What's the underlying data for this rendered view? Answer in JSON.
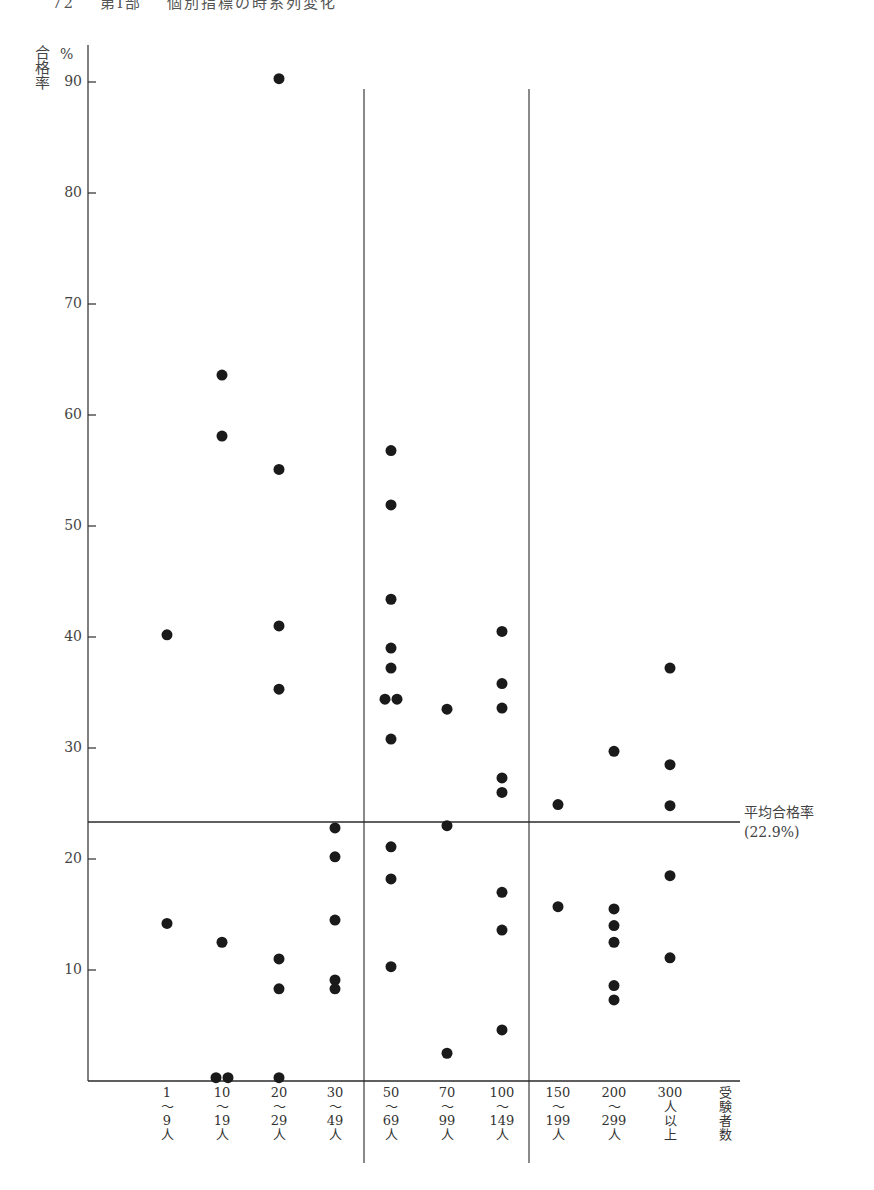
{
  "page_header": {
    "page_number": "72",
    "chapter": "第Ⅰ部",
    "section": "個別指標の時系列変化"
  },
  "chart_data": {
    "type": "scatter",
    "title": "",
    "ylabel": "合格率",
    "ylabel_unit": "%",
    "xlabel": "受験者数",
    "ylim": [
      0,
      92
    ],
    "y_ticks": [
      10,
      20,
      30,
      40,
      50,
      60,
      70,
      80,
      90
    ],
    "grid": false,
    "categories": [
      "1〜9人",
      "10〜19人",
      "20〜29人",
      "30〜49人",
      "50〜69人",
      "70〜99人",
      "100〜149人",
      "150〜199人",
      "200〜299人",
      "300人以上"
    ],
    "category_labels": [
      [
        "1",
        "〜",
        "9",
        "人"
      ],
      [
        "10",
        "〜",
        "19",
        "人"
      ],
      [
        "20",
        "〜",
        "29",
        "人"
      ],
      [
        "30",
        "〜",
        "49",
        "人"
      ],
      [
        "50",
        "〜",
        "69",
        "人"
      ],
      [
        "70",
        "〜",
        "99",
        "人"
      ],
      [
        "100",
        "〜",
        "149",
        "人"
      ],
      [
        "150",
        "〜",
        "199",
        "人"
      ],
      [
        "200",
        "〜",
        "299",
        "人"
      ],
      [
        "300",
        "人",
        "以",
        "上"
      ]
    ],
    "xlabel_chars": [
      "受",
      "験",
      "者",
      "数"
    ],
    "points": [
      {
        "category": "1〜9人",
        "values": [
          40.2,
          14.2
        ]
      },
      {
        "category": "10〜19人",
        "values": [
          63.6,
          58.1,
          12.5,
          0.3,
          0.3
        ]
      },
      {
        "category": "20〜29人",
        "values": [
          90.3,
          55.1,
          41.0,
          35.3,
          11.0,
          8.3,
          0.3
        ]
      },
      {
        "category": "30〜49人",
        "values": [
          22.8,
          20.2,
          14.5,
          9.1,
          8.3
        ]
      },
      {
        "category": "50〜69人",
        "values": [
          56.8,
          51.9,
          43.4,
          39.0,
          37.2,
          34.4,
          34.4,
          30.8,
          21.1,
          18.2,
          10.3
        ]
      },
      {
        "category": "70〜99人",
        "values": [
          33.5,
          23.0,
          2.5
        ]
      },
      {
        "category": "100〜149人",
        "values": [
          40.5,
          35.8,
          33.6,
          27.3,
          26.0,
          17.0,
          13.6,
          4.6
        ]
      },
      {
        "category": "150〜199人",
        "values": [
          24.9,
          15.7
        ]
      },
      {
        "category": "200〜299人",
        "values": [
          29.7,
          15.5,
          14.0,
          12.5,
          8.6,
          7.3
        ]
      },
      {
        "category": "300人以上",
        "values": [
          37.2,
          28.5,
          24.8,
          18.5,
          11.1
        ]
      }
    ],
    "reference_line": {
      "label": "平均合格率",
      "value_label": "(22.9%)",
      "value": 22.9
    },
    "group_dividers_after": [
      "30〜49人",
      "100〜149人"
    ]
  }
}
